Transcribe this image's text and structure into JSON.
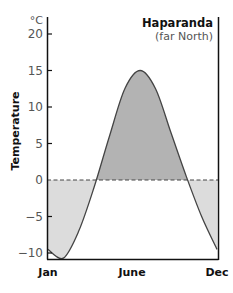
{
  "chart": {
    "title": "Haparanda",
    "subtitle": "(far North)",
    "unit": "°C",
    "ylabel": "Temperature",
    "yticks": [
      "20",
      "15",
      "10",
      "5",
      "0",
      "−5",
      "−10"
    ],
    "xticks": [
      "Jan",
      "June",
      "Dec"
    ]
  },
  "colors": {
    "above_zero_fill": "#b3b3b3",
    "below_zero_fill": "#dcdcdc",
    "line": "#444444",
    "axis": "#111111"
  },
  "chart_data": {
    "type": "area",
    "title": "Haparanda (far North)",
    "xlabel": "",
    "ylabel": "Temperature (°C)",
    "x": [
      "Jan",
      "Feb",
      "Mar",
      "Apr",
      "May",
      "Jun",
      "Jul",
      "Aug",
      "Sep",
      "Oct",
      "Nov",
      "Dec"
    ],
    "x_tick_labels": [
      "Jan",
      "June",
      "Dec"
    ],
    "series": [
      {
        "name": "Temperature",
        "values": [
          -9.5,
          -10.7,
          -7,
          -1,
          6,
          12.5,
          15,
          12.5,
          6.5,
          0.5,
          -5,
          -9.5
        ]
      }
    ],
    "ylim": [
      -11,
      21
    ],
    "yticks": [
      -10,
      -5,
      0,
      5,
      10,
      15,
      20
    ],
    "annotations": [
      "Dashed line at 0 °C; area above zero shaded dark gray, below zero shaded light gray"
    ],
    "grid": false,
    "legend": "none"
  }
}
